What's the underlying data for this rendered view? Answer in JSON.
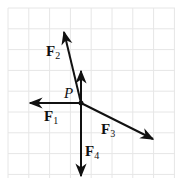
{
  "diagram": {
    "grid": {
      "visible": true,
      "color": "#e6e6e6",
      "x0": 8,
      "y0": 8,
      "x1": 175,
      "y1": 178,
      "spacing": 20.8
    },
    "point": {
      "label": "P",
      "x": 81,
      "y": 103
    },
    "arrows": [
      {
        "name": "F1",
        "letter": "F",
        "sub": "1",
        "to": [
          30,
          103
        ],
        "label_pos": [
          44,
          108
        ]
      },
      {
        "name": "F2",
        "letter": "F",
        "sub": "2",
        "to": [
          64,
          32
        ],
        "label_pos": [
          46,
          44
        ]
      },
      {
        "name": "unlabeled-up",
        "letter": "",
        "sub": "",
        "to": [
          81,
          71
        ],
        "label_pos": null
      },
      {
        "name": "F3",
        "letter": "F",
        "sub": "3",
        "to": [
          153,
          139
        ],
        "label_pos": [
          101,
          121
        ]
      },
      {
        "name": "F4",
        "letter": "F",
        "sub": "4",
        "to": [
          81,
          176
        ],
        "label_pos": [
          85,
          143
        ]
      }
    ],
    "labels": {
      "P": "P",
      "F1": {
        "letter": "F",
        "sub": "1"
      },
      "F2": {
        "letter": "F",
        "sub": "2"
      },
      "F3": {
        "letter": "F",
        "sub": "3"
      },
      "F4": {
        "letter": "F",
        "sub": "4"
      }
    },
    "colors": {
      "stroke": "#111111",
      "grid": "#e6e6e6"
    }
  }
}
